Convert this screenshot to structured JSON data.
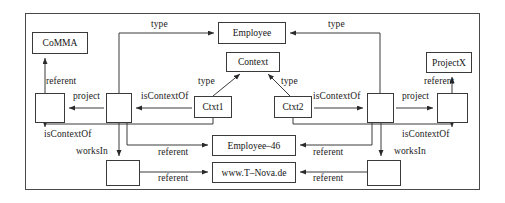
{
  "diagram": {
    "frame": {
      "name": "outer-frame"
    },
    "colors": {
      "stroke": "#3a3a3a",
      "text": "#141414",
      "background": "#ffffff"
    },
    "nodes": [
      {
        "id": "comma",
        "label": "CoMMA",
        "x": 32,
        "y": 32,
        "w": 56,
        "h": 22,
        "named": true
      },
      {
        "id": "employee",
        "label": "Employee",
        "x": 218,
        "y": 22,
        "w": 68,
        "h": 22,
        "named": true
      },
      {
        "id": "context",
        "label": "Context",
        "x": 226,
        "y": 52,
        "w": 54,
        "h": 20,
        "named": true
      },
      {
        "id": "projectx",
        "label": "ProjectX",
        "x": 426,
        "y": 52,
        "w": 46,
        "h": 21,
        "named": true
      },
      {
        "id": "ctxt1",
        "label": "Ctxt1",
        "x": 194,
        "y": 96,
        "w": 38,
        "h": 22,
        "named": true
      },
      {
        "id": "ctxt2",
        "label": "Ctxt2",
        "x": 274,
        "y": 96,
        "w": 38,
        "h": 22,
        "named": true
      },
      {
        "id": "employee46",
        "label": "Employee–46",
        "x": 212,
        "y": 135,
        "w": 84,
        "h": 21,
        "named": true
      },
      {
        "id": "tnova",
        "label": "www.T–Nova.de",
        "x": 212,
        "y": 162,
        "w": 84,
        "h": 21,
        "named": true
      },
      {
        "id": "blank-left",
        "label": "",
        "x": 35,
        "y": 93,
        "w": 30,
        "h": 30,
        "named": false
      },
      {
        "id": "blank-left-mid",
        "label": "",
        "x": 106,
        "y": 93,
        "w": 26,
        "h": 30,
        "named": false
      },
      {
        "id": "blank-right-mid",
        "label": "",
        "x": 367,
        "y": 93,
        "w": 27,
        "h": 30,
        "named": false
      },
      {
        "id": "blank-right",
        "label": "",
        "x": 437,
        "y": 93,
        "w": 31,
        "h": 30,
        "named": false
      },
      {
        "id": "blank-bottom-left",
        "label": "",
        "x": 106,
        "y": 160,
        "w": 34,
        "h": 26,
        "named": false
      },
      {
        "id": "blank-bottom-right",
        "label": "",
        "x": 367,
        "y": 160,
        "w": 34,
        "h": 26,
        "named": false
      }
    ],
    "edge_labels": [
      {
        "id": "type-left",
        "text": "type",
        "x": 151,
        "y": 20
      },
      {
        "id": "type-right",
        "text": "type",
        "x": 328,
        "y": 20
      },
      {
        "id": "referent-comma",
        "text": "referent",
        "x": 46,
        "y": 77
      },
      {
        "id": "referent-projectx",
        "text": "referent",
        "x": 424,
        "y": 77
      },
      {
        "id": "type-ctxt1",
        "text": "type",
        "x": 198,
        "y": 77
      },
      {
        "id": "type-ctxt2",
        "text": "type",
        "x": 281,
        "y": 77
      },
      {
        "id": "project-left",
        "text": "project",
        "x": 73,
        "y": 92
      },
      {
        "id": "project-right",
        "text": "project",
        "x": 402,
        "y": 92
      },
      {
        "id": "iscontextof-1",
        "text": "isContextOf",
        "x": 141,
        "y": 92
      },
      {
        "id": "iscontextof-2",
        "text": "isContextOf",
        "x": 313,
        "y": 92
      },
      {
        "id": "iscontextof-3",
        "text": "isContextOf",
        "x": 44,
        "y": 130
      },
      {
        "id": "iscontextof-4",
        "text": "isContextOf",
        "x": 402,
        "y": 130
      },
      {
        "id": "worksin-left",
        "text": "worksIn",
        "x": 76,
        "y": 147
      },
      {
        "id": "worksin-right",
        "text": "worksIn",
        "x": 394,
        "y": 147
      },
      {
        "id": "referent-emp46-l",
        "text": "referent",
        "x": 158,
        "y": 148
      },
      {
        "id": "referent-emp46-r",
        "text": "referent",
        "x": 313,
        "y": 148
      },
      {
        "id": "referent-tnova-l",
        "text": "referent",
        "x": 158,
        "y": 174
      },
      {
        "id": "referent-tnova-r",
        "text": "referent",
        "x": 313,
        "y": 174
      }
    ],
    "relations": [
      {
        "from": "blank-left-mid",
        "to": "employee",
        "label": "type"
      },
      {
        "from": "blank-right-mid",
        "to": "employee",
        "label": "type"
      },
      {
        "from": "ctxt1",
        "to": "context",
        "label": "type"
      },
      {
        "from": "ctxt2",
        "to": "context",
        "label": "type"
      },
      {
        "from": "blank-left",
        "to": "comma",
        "label": "referent"
      },
      {
        "from": "blank-right",
        "to": "projectx",
        "label": "referent"
      },
      {
        "from": "blank-left-mid",
        "to": "blank-left",
        "label": "project"
      },
      {
        "from": "blank-right-mid",
        "to": "blank-right",
        "label": "project"
      },
      {
        "from": "ctxt1",
        "to": "blank-left-mid",
        "label": "isContextOf"
      },
      {
        "from": "ctxt2",
        "to": "blank-right-mid",
        "label": "isContextOf"
      },
      {
        "from": "ctxt1",
        "to": "blank-left",
        "label": "isContextOf"
      },
      {
        "from": "ctxt2",
        "to": "blank-right",
        "label": "isContextOf"
      },
      {
        "from": "blank-left-mid",
        "to": "blank-bottom-left",
        "label": "worksIn"
      },
      {
        "from": "blank-right-mid",
        "to": "blank-bottom-right",
        "label": "worksIn"
      },
      {
        "from": "blank-left-mid",
        "to": "employee46",
        "label": "referent"
      },
      {
        "from": "blank-right-mid",
        "to": "employee46",
        "label": "referent"
      },
      {
        "from": "blank-bottom-left",
        "to": "tnova",
        "label": "referent"
      },
      {
        "from": "blank-bottom-right",
        "to": "tnova",
        "label": "referent"
      }
    ]
  }
}
